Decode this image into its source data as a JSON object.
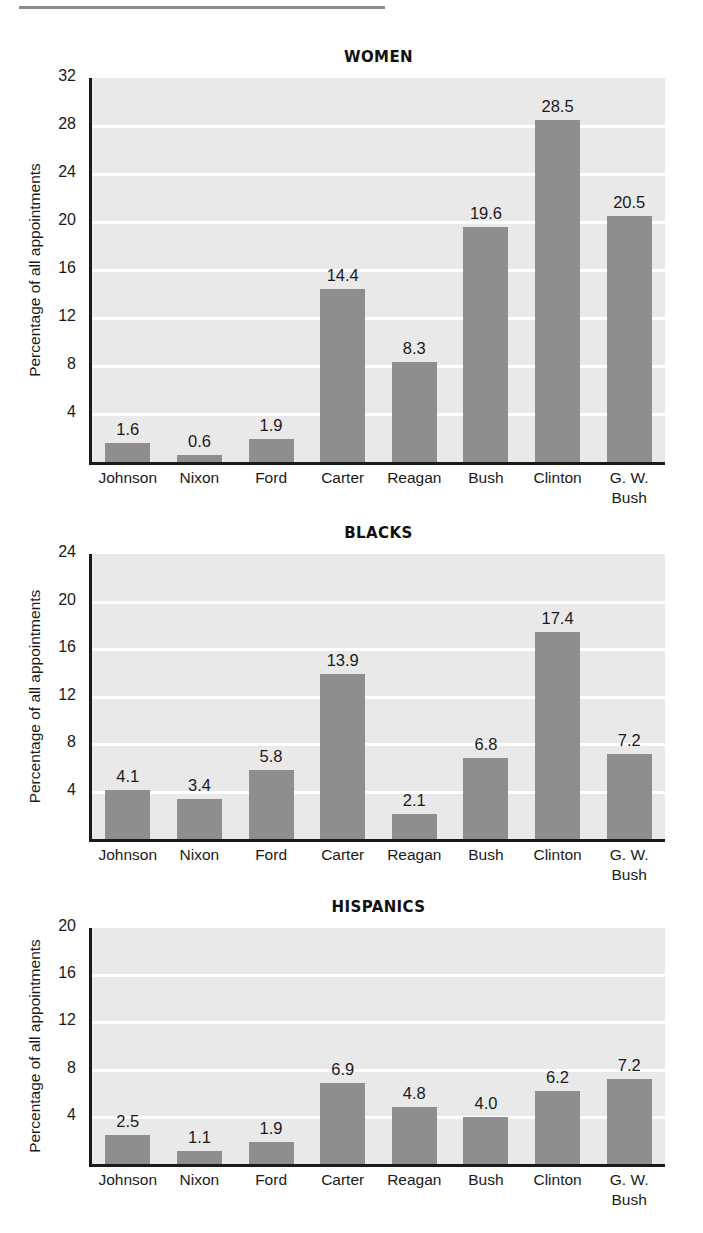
{
  "page": {
    "rule_color": "#8a8a8a",
    "bar_color": "#8e8e8e",
    "plot_bg_color": "#e9e9e9",
    "gridline_color": "#ffffff",
    "axis_color": "#1a1a1a"
  },
  "chart_data": [
    {
      "type": "bar",
      "title": "WOMEN",
      "xlabel": "",
      "ylabel": "Percentage of all appointments",
      "categories": [
        "Johnson",
        "Nixon",
        "Ford",
        "Carter",
        "Reagan",
        "Bush",
        "Clinton",
        "G. W.\nBush"
      ],
      "values": [
        1.6,
        0.6,
        1.9,
        14.4,
        8.3,
        19.6,
        28.5,
        20.5
      ],
      "value_labels": [
        "1.6",
        "0.6",
        "1.9",
        "14.4",
        "8.3",
        "19.6",
        "28.5",
        "20.5"
      ],
      "yticks": [
        4,
        8,
        12,
        16,
        20,
        24,
        28,
        32
      ],
      "ytick_labels": [
        "4",
        "8",
        "12",
        "16",
        "20",
        "24",
        "28",
        "32"
      ],
      "ylim": [
        0,
        32
      ],
      "grid": true,
      "legend": "none"
    },
    {
      "type": "bar",
      "title": "BLACKS",
      "xlabel": "",
      "ylabel": "Percentage of all appointments",
      "categories": [
        "Johnson",
        "Nixon",
        "Ford",
        "Carter",
        "Reagan",
        "Bush",
        "Clinton",
        "G. W.\nBush"
      ],
      "values": [
        4.1,
        3.4,
        5.8,
        13.9,
        2.1,
        6.8,
        17.4,
        7.2
      ],
      "value_labels": [
        "4.1",
        "3.4",
        "5.8",
        "13.9",
        "2.1",
        "6.8",
        "17.4",
        "7.2"
      ],
      "yticks": [
        4,
        8,
        12,
        16,
        20,
        24
      ],
      "ytick_labels": [
        "4",
        "8",
        "12",
        "16",
        "20",
        "24"
      ],
      "ylim": [
        0,
        24
      ],
      "grid": true,
      "legend": "none"
    },
    {
      "type": "bar",
      "title": "HISPANICS",
      "xlabel": "",
      "ylabel": "Percentage of all appointments",
      "categories": [
        "Johnson",
        "Nixon",
        "Ford",
        "Carter",
        "Reagan",
        "Bush",
        "Clinton",
        "G. W.\nBush"
      ],
      "values": [
        2.5,
        1.1,
        1.9,
        6.9,
        4.8,
        4.0,
        6.2,
        7.2
      ],
      "value_labels": [
        "2.5",
        "1.1",
        "1.9",
        "6.9",
        "4.8",
        "4.0",
        "6.2",
        "7.2"
      ],
      "yticks": [
        4,
        8,
        12,
        16,
        20
      ],
      "ytick_labels": [
        "4",
        "8",
        "12",
        "16",
        "20"
      ],
      "ylim": [
        0,
        20
      ],
      "grid": true,
      "legend": "none"
    }
  ]
}
